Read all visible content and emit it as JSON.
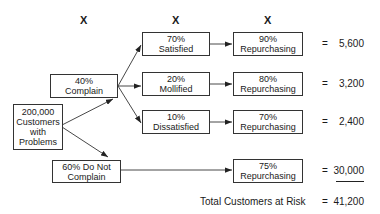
{
  "column_markers": [
    "X",
    "X",
    "X"
  ],
  "root": {
    "line1": "200,000",
    "line2": "Customers",
    "line3": "with",
    "line4": "Problems"
  },
  "complain": {
    "line1": "40%",
    "line2": "Complain"
  },
  "not_complain": {
    "line1": "60% Do Not",
    "line2": "Complain"
  },
  "outcomes": [
    {
      "line1": "70%",
      "line2": "Satisfied"
    },
    {
      "line1": "20%",
      "line2": "Mollified"
    },
    {
      "line1": "10%",
      "line2": "Dissatisfied"
    }
  ],
  "repurchasing": [
    {
      "line1": "90%",
      "line2": "Repurchasing",
      "equals": "=",
      "value": "5,600"
    },
    {
      "line1": "80%",
      "line2": "Repurchasing",
      "equals": "=",
      "value": "3,200"
    },
    {
      "line1": "70%",
      "line2": "Repurchasing",
      "equals": "=",
      "value": "2,400"
    },
    {
      "line1": "75%",
      "line2": "Repurchasing",
      "equals": "=",
      "value": "30,000"
    }
  ],
  "total": {
    "label": "Total Customers at Risk",
    "equals": "=",
    "value": "41,200"
  }
}
